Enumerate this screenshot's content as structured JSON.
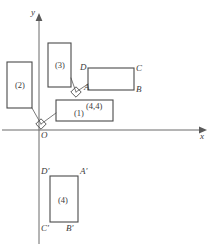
{
  "figure": {
    "background_color": "#ffffff",
    "stroke_color": "#4a4a4a",
    "text_color": "#3a3a3a"
  },
  "axes": {
    "x_axis_label": "x",
    "y_axis_label": "y",
    "origin_label": "O",
    "x_axis_y_px": 130,
    "y_axis_x_px": 39,
    "x_axis_start_px": 2,
    "x_axis_end_px": 206,
    "y_axis_top_px": 14,
    "y_axis_bottom_px": 244
  },
  "rectangles": [
    {
      "name": "rect-1",
      "label": "(1)",
      "x": 56,
      "y": 100,
      "width": 57,
      "height": 21,
      "label_x": 74,
      "label_y": 109
    },
    {
      "name": "rect-2",
      "label": "(2)",
      "x": 7,
      "y": 62,
      "width": 25,
      "height": 46,
      "label_x": 15,
      "label_y": 81
    },
    {
      "name": "rect-3",
      "label": "(3)",
      "x": 48,
      "y": 43,
      "width": 23,
      "height": 44,
      "label_x": 55,
      "label_y": 61
    },
    {
      "name": "rect-4",
      "label": "(4)",
      "x": 50,
      "y": 176,
      "width": 28,
      "height": 46,
      "label_x": 58,
      "label_y": 196
    },
    {
      "name": "rect-abcd",
      "label": "",
      "x": 88,
      "y": 68,
      "width": 46,
      "height": 22,
      "label_x": 0,
      "label_y": 0
    }
  ],
  "vertex_labels": [
    {
      "name": "vertex-label-A",
      "text": "A",
      "x": 84,
      "y": 83
    },
    {
      "name": "vertex-label-B",
      "text": "B",
      "x": 136,
      "y": 85
    },
    {
      "name": "vertex-label-C",
      "text": "C",
      "x": 136,
      "y": 64
    },
    {
      "name": "vertex-label-D",
      "text": "D",
      "x": 80,
      "y": 63
    },
    {
      "name": "vertex-label-A-prime",
      "text": "A′",
      "x": 80,
      "y": 167
    },
    {
      "name": "vertex-label-B-prime",
      "text": "B′",
      "x": 66,
      "y": 224
    },
    {
      "name": "vertex-label-C-prime",
      "text": "C′",
      "x": 41,
      "y": 224
    },
    {
      "name": "vertex-label-D-prime",
      "text": "D′",
      "x": 41,
      "y": 167
    }
  ],
  "annotations": [
    {
      "name": "point-coordinate-label",
      "text": "(4,4)",
      "x": 86,
      "y": 102
    }
  ],
  "right_angle_markers": [
    {
      "name": "right-angle-marker-origin",
      "cx": 41,
      "cy": 124
    },
    {
      "name": "right-angle-marker-upper",
      "cx": 76,
      "cy": 92
    }
  ],
  "connector_segments": [
    {
      "name": "connector-rect2-to-origin",
      "x1": 32,
      "y1": 108,
      "x2": 41,
      "y2": 124
    },
    {
      "name": "connector-origin-to-rect1",
      "x1": 41,
      "y1": 124,
      "x2": 56,
      "y2": 113
    },
    {
      "name": "connector-rect3-to-marker",
      "x1": 71,
      "y1": 78,
      "x2": 76,
      "y2": 92
    },
    {
      "name": "connector-marker-to-A",
      "x1": 76,
      "y1": 92,
      "x2": 88,
      "y2": 84
    }
  ]
}
